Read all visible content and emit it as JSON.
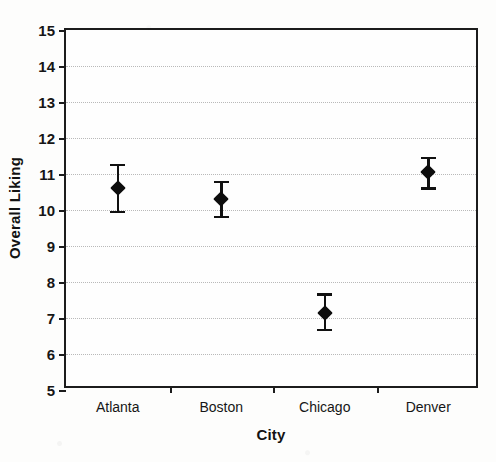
{
  "chart_data": {
    "type": "scatter",
    "title": "",
    "xlabel": "City",
    "ylabel": "Overall Liking",
    "categories": [
      "Atlanta",
      "Boston",
      "Chicago",
      "Denver"
    ],
    "values": [
      10.6,
      10.3,
      7.15,
      11.05
    ],
    "error_upper": [
      11.25,
      10.78,
      7.65,
      11.45
    ],
    "error_lower": [
      9.95,
      9.8,
      6.67,
      10.6
    ],
    "ylim": [
      5,
      15
    ],
    "y_ticks": [
      5,
      6,
      7,
      8,
      9,
      10,
      11,
      12,
      13,
      14,
      15
    ],
    "y_tick_labels": [
      "5",
      "6",
      "7",
      "8",
      "9",
      "10",
      "11",
      "12",
      "13",
      "14",
      "15"
    ],
    "grid": true,
    "grid_axis": "y",
    "grid_style": "dotted",
    "legend": "none",
    "marker": "diamond",
    "marker_color": "#0d0d0d",
    "errorbar_color": "#111111",
    "series": [
      {
        "name": "Overall Liking",
        "points": [
          {
            "category": "Atlanta",
            "value": 10.6,
            "upper": 11.25,
            "lower": 9.95
          },
          {
            "category": "Boston",
            "value": 10.3,
            "upper": 10.78,
            "lower": 9.8
          },
          {
            "category": "Chicago",
            "value": 7.15,
            "upper": 7.65,
            "lower": 6.67
          },
          {
            "category": "Denver",
            "value": 11.05,
            "upper": 11.45,
            "lower": 10.6
          }
        ]
      }
    ]
  },
  "axes": {
    "y_title": "Overall Liking",
    "x_title": "City"
  }
}
